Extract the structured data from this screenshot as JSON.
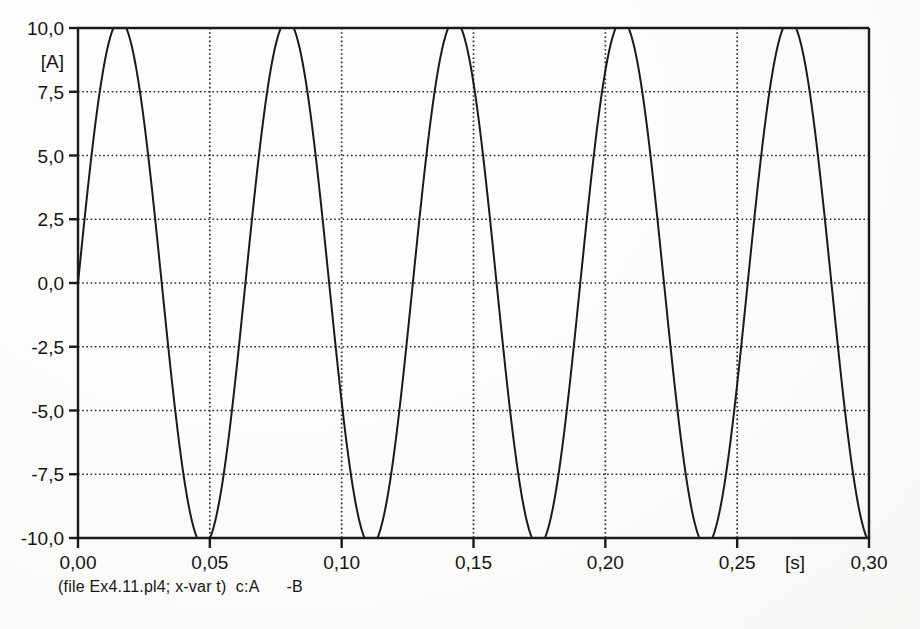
{
  "chart_data": {
    "type": "line",
    "title": "",
    "subtitle": "",
    "xlabel": "[s]",
    "ylabel": "[A]",
    "xlim": [
      0.0,
      0.3
    ],
    "ylim": [
      -10.0,
      10.0
    ],
    "grid": true,
    "grid_style": "dotted",
    "legend_position": "none",
    "x_ticks": [
      0.0,
      0.05,
      0.1,
      0.15,
      0.2,
      0.25,
      0.3
    ],
    "x_tick_labels": [
      "0,00",
      "0,05",
      "0,10",
      "0,15",
      "0,20",
      "0,25",
      "0,30"
    ],
    "y_ticks": [
      10.0,
      7.5,
      5.0,
      2.5,
      0.0,
      -2.5,
      -5.0,
      -7.5,
      -10.0
    ],
    "y_tick_labels": [
      "10,0",
      "7,5",
      "5,0",
      "2,5",
      "0,0",
      "-2,5",
      "-5,0",
      "-7,5",
      "-10,0"
    ],
    "series": [
      {
        "name": "c:A -B",
        "waveform": "sine",
        "amplitude": 10.3,
        "period_s": 0.0635,
        "frequency_hz": 15.75,
        "phase_deg": 0,
        "offset": 0.0,
        "color": "#1a1a1a",
        "peaks_t": [
          0.0159,
          0.0794,
          0.1429,
          0.2064,
          0.2699
        ],
        "peaks_v": [
          10.3,
          10.3,
          10.3,
          10.3,
          10.3
        ],
        "troughs_t": [
          0.0476,
          0.1111,
          0.1746,
          0.2381
        ],
        "troughs_v": [
          -10.3,
          -10.3,
          -10.3,
          -10.3
        ],
        "zero_crossings_t": [
          0.0,
          0.0318,
          0.0635,
          0.0953,
          0.127,
          0.1588,
          0.1905,
          0.2223,
          0.254,
          0.2858
        ]
      }
    ]
  },
  "caption": {
    "text": "(file Ex4.11.pl4; x-var t)  c:A      -B",
    "file": "Ex4.11.pl4",
    "x_var": "t",
    "curve_labels": [
      "c:A",
      "-B"
    ]
  },
  "axes": {
    "y_unit": "[A]",
    "x_unit": "[s]"
  }
}
